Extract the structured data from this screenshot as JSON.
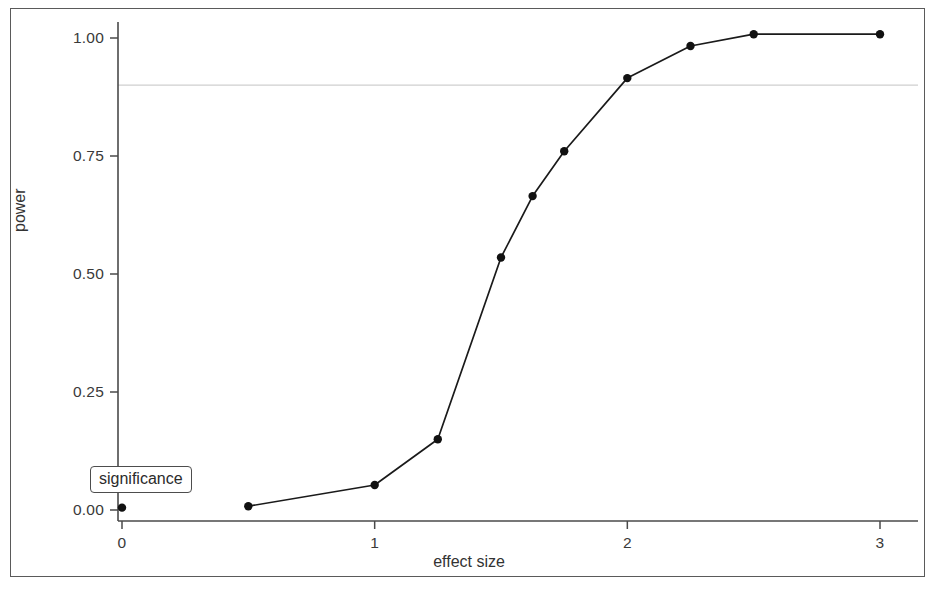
{
  "chart_data": {
    "type": "line",
    "title": "",
    "subtitle": "",
    "xlabel": "effect size",
    "ylabel": "power",
    "xlim": [
      -0.08,
      3.12
    ],
    "ylim": [
      -0.02,
      1.04
    ],
    "grid": false,
    "legend_position": "none",
    "x_ticks": [
      "0",
      "1",
      "2",
      "3"
    ],
    "x_tick_values": [
      0,
      1,
      2,
      3
    ],
    "y_ticks": [
      "0.00",
      "0.25",
      "0.50",
      "0.75",
      "1.00"
    ],
    "y_tick_values": [
      0,
      0.25,
      0.5,
      0.75,
      1.0
    ],
    "series": [
      {
        "name": "power curve",
        "marker": "filled-circle",
        "color": "#1a1a1a",
        "x": [
          0,
          0.5,
          1.0,
          1.25,
          1.5,
          1.625,
          1.75,
          2.0,
          2.25,
          2.5,
          3.0
        ],
        "values": [
          0.005,
          0.008,
          0.053,
          0.15,
          0.535,
          0.665,
          0.76,
          0.915,
          0.983,
          1.008,
          1.008
        ]
      }
    ],
    "annotations": [
      {
        "name": "significance-threshold-line",
        "type": "hline",
        "y": 0.9,
        "color": "#cfcfcf",
        "label": "significance"
      }
    ]
  },
  "axes": {
    "y_title": "power",
    "x_title": "effect size"
  },
  "annotation_box": {
    "label": "significance"
  },
  "colors": {
    "line": "#1a1a1a",
    "marker": "#111111",
    "axis": "#4a4a4a",
    "frame": "#5a5a5a",
    "reference_line": "#d2d2d2",
    "background": "#ffffff"
  }
}
